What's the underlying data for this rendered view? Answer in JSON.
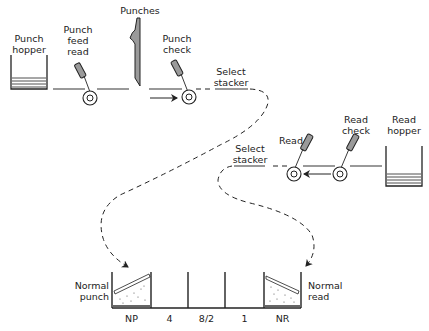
{
  "diagram": {
    "punch_side": {
      "hopper_label": [
        "Punch",
        "hopper"
      ],
      "feed_read_label": [
        "Punch",
        "feed",
        "read"
      ],
      "punches_label": "Punches",
      "check_label": [
        "Punch",
        "check"
      ],
      "select_stacker_label": [
        "Select",
        "stacker"
      ],
      "direction": "left-to-right"
    },
    "read_side": {
      "read_label": "Read",
      "check_label": [
        "Read",
        "check"
      ],
      "hopper_label": [
        "Read",
        "hopper"
      ],
      "select_stacker_label": [
        "Select",
        "stacker"
      ],
      "direction": "right-to-left"
    },
    "stackers": {
      "left_label": [
        "Normal",
        "punch"
      ],
      "right_label": [
        "Normal",
        "read"
      ],
      "pockets": [
        "NP",
        "4",
        "8/2",
        "1",
        "NR"
      ]
    },
    "colors": {
      "line": "#222222",
      "fill": "#9a9a9a",
      "background": "#ffffff"
    }
  }
}
